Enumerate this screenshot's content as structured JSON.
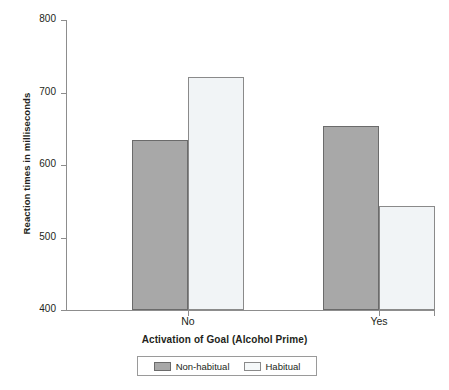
{
  "chart_data": {
    "type": "bar",
    "title": "",
    "xlabel": "Activation of Goal (Alcohol Prime)",
    "ylabel": "Reaction times in milliseconds",
    "categories": [
      "No",
      "Yes"
    ],
    "series": [
      {
        "name": "Non-habitual",
        "values": [
          635,
          654
        ],
        "color": "#a8a8a8"
      },
      {
        "name": "Habitual",
        "values": [
          721,
          544
        ],
        "color": "#f1f4f6"
      }
    ],
    "ylim": [
      400,
      800
    ],
    "yticks": [
      400,
      500,
      600,
      700,
      800
    ],
    "ytick_labels": [
      "400",
      "500",
      "600",
      "700",
      "800"
    ],
    "grid": false,
    "legend_position": "bottom"
  },
  "legend": {
    "entries": [
      {
        "label": "Non-habitual"
      },
      {
        "label": "Habitual"
      }
    ]
  }
}
